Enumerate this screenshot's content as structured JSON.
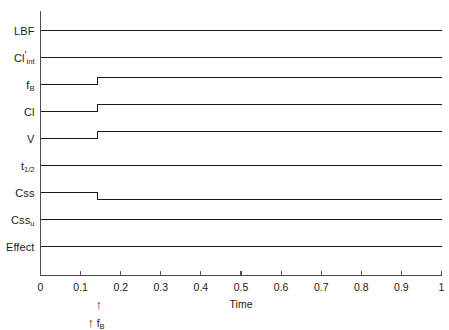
{
  "chart_data": {
    "type": "line",
    "title": "",
    "subtitle": "",
    "xlabel": "Time",
    "ylabel": "",
    "xlim": [
      0,
      1
    ],
    "ylim": [
      0,
      9
    ],
    "grid": false,
    "legend": null,
    "x_ticks": [
      "0",
      "0.1",
      "0.2",
      "0.3",
      "0.4",
      "0.5",
      "0.6",
      "0.7",
      "0.8",
      "0.9",
      "1"
    ],
    "x_tick_values": [
      0,
      0.1,
      0.2,
      0.3,
      0.4,
      0.5,
      0.6,
      0.7,
      0.8,
      0.9,
      1.0
    ],
    "y_ticks": [],
    "step_time": 0.142,
    "series": [
      {
        "name": "LBF",
        "label_html": "LBF",
        "row": 0,
        "baseline": 0,
        "change": "none",
        "x": [
          0,
          0.142,
          0.142,
          1
        ],
        "values": [
          0,
          0,
          0,
          0
        ]
      },
      {
        "name": "Cl'int",
        "label_html": "Cl<span class=\"prime\">′</span><sub>int</sub>",
        "row": 1,
        "baseline": 0,
        "change": "none",
        "x": [
          0,
          0.142,
          0.142,
          1
        ],
        "values": [
          0,
          0,
          0,
          0
        ]
      },
      {
        "name": "fB",
        "label_html": "f<sub>B</sub>",
        "row": 2,
        "baseline": 0,
        "change": "increase",
        "x": [
          0,
          0.142,
          0.142,
          1
        ],
        "values": [
          0,
          0,
          1,
          1
        ]
      },
      {
        "name": "Cl",
        "label_html": "Cl",
        "row": 3,
        "baseline": 0,
        "change": "increase",
        "x": [
          0,
          0.142,
          0.142,
          1
        ],
        "values": [
          0,
          0,
          1,
          1
        ]
      },
      {
        "name": "V",
        "label_html": "V",
        "row": 4,
        "baseline": 0,
        "change": "increase",
        "x": [
          0,
          0.142,
          0.142,
          1
        ],
        "values": [
          0,
          0,
          1,
          1
        ]
      },
      {
        "name": "t1/2",
        "label_html": "t<sub>1/2</sub>",
        "row": 5,
        "baseline": 0,
        "change": "none",
        "x": [
          0,
          0.142,
          0.142,
          1
        ],
        "values": [
          0,
          0,
          0,
          0
        ]
      },
      {
        "name": "Css",
        "label_html": "Css",
        "row": 6,
        "baseline": 0,
        "change": "decrease",
        "x": [
          0,
          0.142,
          0.142,
          1
        ],
        "values": [
          0,
          0,
          -1,
          -1
        ]
      },
      {
        "name": "Cssu",
        "label_html": "Css<sub>u</sub>",
        "row": 7,
        "baseline": 0,
        "change": "none",
        "x": [
          0,
          0.142,
          0.142,
          1
        ],
        "values": [
          0,
          0,
          0,
          0
        ]
      },
      {
        "name": "Effect",
        "label_html": "Effect",
        "row": 8,
        "baseline": 0,
        "change": "none",
        "x": [
          0,
          0.142,
          0.142,
          1
        ],
        "values": [
          0,
          0,
          0,
          0
        ]
      }
    ],
    "annotations": [
      {
        "name": "perturbation-arrow-upper",
        "glyph": "↑",
        "x": 0.145,
        "text": ""
      },
      {
        "name": "perturbation-arrow-lower",
        "glyph": "↑",
        "x": 0.125,
        "text": "f",
        "text_sub": "B"
      }
    ],
    "colors": {
      "trace": "#1a1a1a",
      "axis": "#4d4d4d",
      "text": "#1a1a1a",
      "background": "#ffffff"
    }
  },
  "labels": {
    "row_0": "LBF",
    "row_1": "Cl'int",
    "row_2": "fB",
    "row_3": "Cl",
    "row_4": "V",
    "row_5": "t1/2",
    "row_6": "Css",
    "row_7": "Cssu",
    "row_8": "Effect",
    "x_axis_title": "Time",
    "annotation_label": "fB"
  }
}
